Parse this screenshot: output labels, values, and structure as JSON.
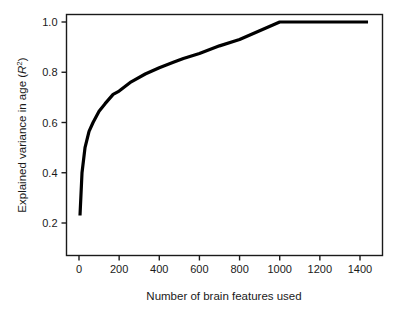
{
  "chart_data": {
    "type": "line",
    "title": "",
    "xlabel": "Number of brain features used",
    "ylabel_parts": {
      "main": "Explained variance in age (",
      "symbol": "R",
      "superscript": "2",
      "close": ")"
    },
    "ylabel": "Explained variance in age (R2)",
    "xlim": [
      -60,
      1500
    ],
    "ylim": [
      0.13,
      1.05
    ],
    "grid": false,
    "legend": false,
    "xticks": [
      0,
      200,
      400,
      600,
      800,
      1000,
      1200,
      1400
    ],
    "xtick_labels": [
      "0",
      "200",
      "400",
      "600",
      "800",
      "1000",
      "1200",
      "1400"
    ],
    "yticks": [
      0.2,
      0.4,
      0.6,
      0.8,
      1.0
    ],
    "ytick_labels": [
      "0.2",
      "0.4",
      "0.6",
      "0.8",
      "1.0"
    ],
    "series": [
      {
        "name": "Explained variance",
        "color": "#000000",
        "line_width": 3.2,
        "x": [
          5,
          15,
          30,
          50,
          70,
          100,
          130,
          170,
          200,
          260,
          330,
          400,
          470,
          520,
          600,
          700,
          800,
          900,
          1000,
          1150,
          1300,
          1440
        ],
        "y": [
          0.23,
          0.4,
          0.5,
          0.565,
          0.6,
          0.645,
          0.675,
          0.712,
          0.725,
          0.762,
          0.793,
          0.818,
          0.84,
          0.855,
          0.875,
          0.905,
          0.93,
          0.965,
          1.0,
          1.0,
          1.0,
          1.0
        ]
      }
    ]
  },
  "axes": {
    "frame_color": "#1a1a1a",
    "background": "#ffffff"
  }
}
